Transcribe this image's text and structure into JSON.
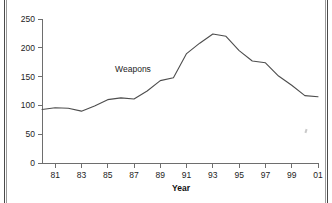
{
  "chart_data": {
    "type": "line",
    "title": "",
    "xlabel": "Year",
    "ylabel": "",
    "series_label": "Weapons",
    "x": [
      1980,
      1981,
      1982,
      1983,
      1984,
      1985,
      1986,
      1987,
      1988,
      1989,
      1990,
      1991,
      1992,
      1993,
      1994,
      1995,
      1996,
      1997,
      1998,
      1999,
      2000,
      2001
    ],
    "x_tick_labels": [
      "81",
      "83",
      "85",
      "87",
      "89",
      "91",
      "93",
      "95",
      "97",
      "99",
      "01"
    ],
    "x_tick_values": [
      1981,
      1983,
      1985,
      1987,
      1989,
      1991,
      1993,
      1995,
      1997,
      1999,
      2001
    ],
    "series": [
      {
        "name": "Weapons",
        "values": [
          93,
          96,
          95,
          90,
          99,
          110,
          113,
          111,
          125,
          143,
          148,
          190,
          208,
          224,
          220,
          195,
          177,
          174,
          151,
          135,
          117,
          115
        ]
      }
    ],
    "y_tick_labels": [
      "0",
      "50",
      "100",
      "150",
      "200",
      "250"
    ],
    "y_tick_values": [
      0,
      50,
      100,
      150,
      200,
      250
    ],
    "xlim": [
      1980,
      2001
    ],
    "ylim": [
      0,
      250
    ],
    "grid": false,
    "legend_position": "inline-annotation",
    "line_color": "#4d4d4d",
    "axis_color": "#6e6e6e",
    "text_color": "#1d1d1d",
    "background_color": "#ffffff"
  }
}
